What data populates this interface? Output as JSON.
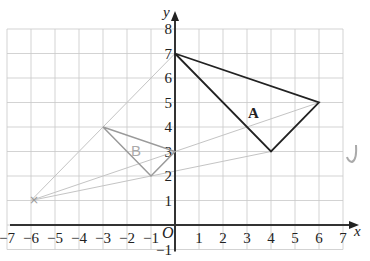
{
  "diagram": {
    "type": "coordinate-grid-enlargement",
    "axes": {
      "x_label": "x",
      "y_label": "y",
      "origin_label": "O",
      "x_range": [
        -7,
        7
      ],
      "y_range": [
        -1,
        8
      ],
      "x_ticks": [
        "−7",
        "−6",
        "−5",
        "−4",
        "−3",
        "−2",
        "−1",
        "1",
        "2",
        "3",
        "4",
        "5",
        "6",
        "7"
      ],
      "y_ticks": [
        "−1",
        "1",
        "2",
        "3",
        "4",
        "5",
        "6",
        "7",
        "8"
      ]
    },
    "shapes": {
      "A": {
        "label": "A",
        "vertices": [
          [
            0,
            7
          ],
          [
            6,
            5
          ],
          [
            4,
            3
          ]
        ],
        "color": "#222222"
      },
      "B": {
        "label": "B",
        "vertices": [
          [
            -3,
            4
          ],
          [
            0,
            3
          ],
          [
            -1,
            2
          ]
        ],
        "color": "#9a9a9a"
      }
    },
    "centre_of_enlargement": {
      "point": [
        -6,
        1
      ],
      "marker": "×",
      "color": "#9a9a9a"
    },
    "construction_lines": [
      {
        "from": [
          -6,
          1
        ],
        "to": [
          0,
          7
        ]
      },
      {
        "from": [
          -6,
          1
        ],
        "to": [
          6,
          5
        ]
      },
      {
        "from": [
          -6,
          1
        ],
        "to": [
          4,
          3
        ]
      }
    ],
    "annotation": {
      "mark": "tick-mark",
      "glyph": "✓"
    }
  }
}
